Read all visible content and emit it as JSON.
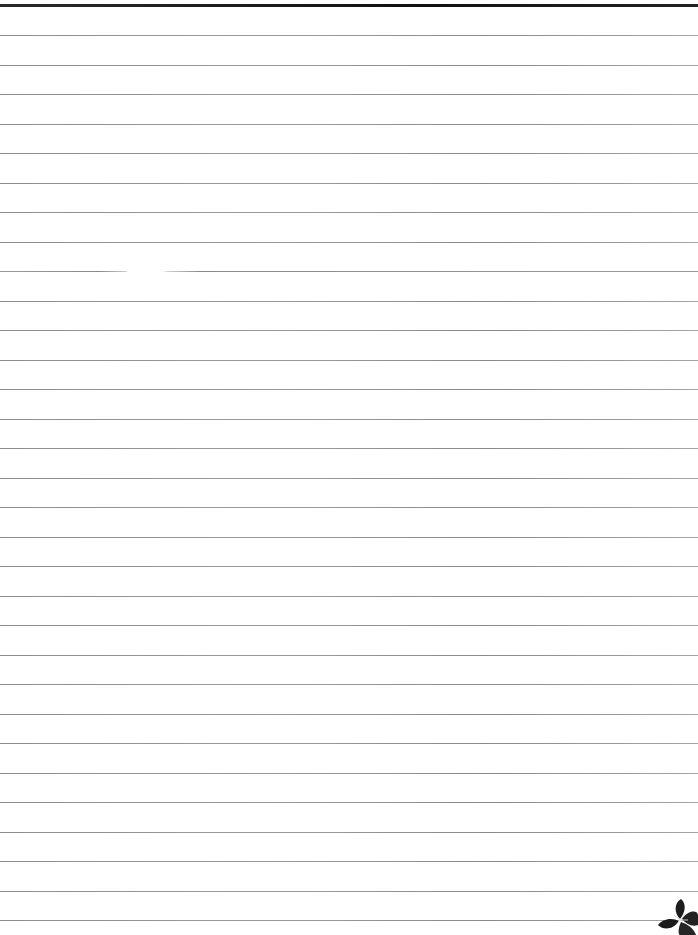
{
  "page": {
    "type": "lined-notebook-paper",
    "background_color": "#ffffff",
    "top_rule_color": "#1a1a1a",
    "rule_color": "#959595",
    "rule_count": 31,
    "rule_start_y": 35,
    "rule_spacing_px": 29.5,
    "decoration": "flower-icon"
  }
}
